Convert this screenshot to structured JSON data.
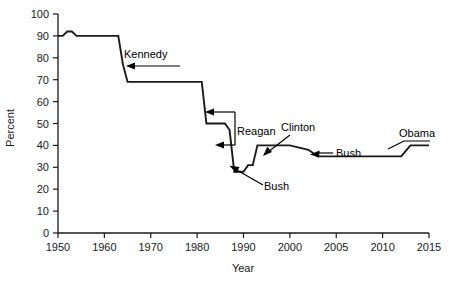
{
  "chart_data": {
    "type": "line",
    "title": "",
    "xlabel": "Year",
    "ylabel": "Percent",
    "grid": false,
    "legend": "none",
    "xlim": [
      1950,
      2015
    ],
    "ylim": [
      0,
      100
    ],
    "x_ticks": [
      1950,
      1960,
      1970,
      1980,
      1990,
      2000,
      2005,
      2010,
      2015
    ],
    "x_tick_labels": [
      "1950",
      "1960",
      "1970",
      "1980",
      "1990",
      "2000",
      "2005",
      "2010",
      "2015"
    ],
    "y_ticks": [
      0,
      10,
      20,
      30,
      40,
      50,
      60,
      70,
      80,
      90,
      100
    ],
    "y_tick_labels": [
      "0",
      "10",
      "20",
      "30",
      "40",
      "50",
      "60",
      "70",
      "80",
      "90",
      "100"
    ],
    "series": [
      {
        "name": "Top marginal tax rate",
        "color": "#1a1a1a",
        "step": true,
        "points": [
          {
            "x": 1950,
            "y": 90
          },
          {
            "x": 1951,
            "y": 90
          },
          {
            "x": 1952,
            "y": 92
          },
          {
            "x": 1953,
            "y": 92
          },
          {
            "x": 1954,
            "y": 90
          },
          {
            "x": 1963,
            "y": 90
          },
          {
            "x": 1964,
            "y": 77
          },
          {
            "x": 1965,
            "y": 69
          },
          {
            "x": 1981,
            "y": 69
          },
          {
            "x": 1982,
            "y": 50
          },
          {
            "x": 1986,
            "y": 50
          },
          {
            "x": 1987,
            "y": 47
          },
          {
            "x": 1988,
            "y": 28
          },
          {
            "x": 1990,
            "y": 28
          },
          {
            "x": 1991,
            "y": 31
          },
          {
            "x": 1992,
            "y": 31
          },
          {
            "x": 1993,
            "y": 40
          },
          {
            "x": 2000,
            "y": 40
          },
          {
            "x": 2001,
            "y": 39
          },
          {
            "x": 2002,
            "y": 38
          },
          {
            "x": 2003,
            "y": 35
          },
          {
            "x": 2012,
            "y": 35
          },
          {
            "x": 2013,
            "y": 40
          },
          {
            "x": 2015,
            "y": 40
          }
        ]
      }
    ],
    "annotations": [
      {
        "label": "Kennedy",
        "points_to_year": 1964,
        "points_to_value": 74
      },
      {
        "label": "Reagan",
        "points_to_year": 1982,
        "points_to_value": 58
      },
      {
        "label": "Reagan",
        "points_to_year": 1987,
        "points_to_value": 42
      },
      {
        "label": "Bush",
        "points_to_year": 1991,
        "points_to_value": 31
      },
      {
        "label": "Clinton",
        "points_to_year": 1993,
        "points_to_value": 40
      },
      {
        "label": "Bush",
        "points_to_year": 2003,
        "points_to_value": 36
      },
      {
        "label": "Obama",
        "points_to_year": 2013,
        "points_to_value": 40
      }
    ]
  }
}
